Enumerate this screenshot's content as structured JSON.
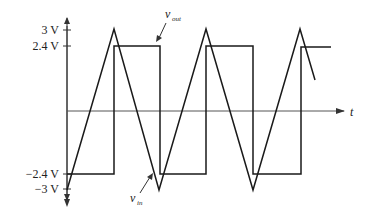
{
  "figure": {
    "type": "comparator-waveforms",
    "axis_labels": {
      "t": "t",
      "y_ticks": [
        {
          "label": "3 V",
          "value": 3
        },
        {
          "label": "2.4 V",
          "value": 2.4
        },
        {
          "label": "−2.4 V",
          "value": -2.4
        },
        {
          "label": "−3 V",
          "value": -3
        }
      ]
    },
    "signals": {
      "vout": {
        "name": "v",
        "sub": "out",
        "shape": "square",
        "high": 2.4,
        "low": -2.4
      },
      "vin": {
        "name": "v",
        "sub": "in",
        "shape": "triangle",
        "peak": 3,
        "trough": -3
      }
    },
    "colors": {
      "line": "#1a1a1a",
      "axis": "#333333",
      "text": "#222222"
    }
  }
}
